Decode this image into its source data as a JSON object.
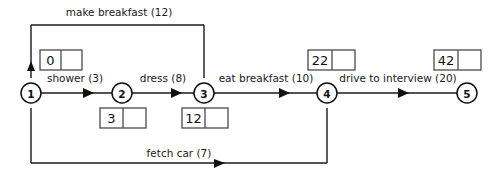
{
  "diagram": {
    "colors": {
      "line": "#1a1a1a",
      "box_stroke": "#4a4a4a",
      "background": "#ffffff",
      "text": "#111111"
    },
    "nodes": [
      {
        "id": "1",
        "label": "1",
        "cx": 31,
        "cy": 93
      },
      {
        "id": "2",
        "label": "2",
        "cx": 122,
        "cy": 93
      },
      {
        "id": "3",
        "label": "3",
        "cx": 204,
        "cy": 93
      },
      {
        "id": "4",
        "label": "4",
        "cx": 327,
        "cy": 93
      },
      {
        "id": "5",
        "label": "5",
        "cx": 467,
        "cy": 93
      }
    ],
    "edges": [
      {
        "name": "shower",
        "label": "shower (3)",
        "duration": 3,
        "from": "1",
        "to": "2",
        "label_x": 75,
        "label_y": 82
      },
      {
        "name": "dress",
        "label": "dress (8)",
        "duration": 8,
        "from": "2",
        "to": "3",
        "label_x": 163,
        "label_y": 82
      },
      {
        "name": "eat-breakfast",
        "label": "eat breakfast (10)",
        "duration": 10,
        "from": "3",
        "to": "4",
        "label_x": 266,
        "label_y": 82
      },
      {
        "name": "drive-to-interview",
        "label": "drive to interview (20)",
        "duration": 20,
        "from": "4",
        "to": "5",
        "label_x": 398,
        "label_y": 82
      },
      {
        "name": "make-breakfast",
        "label": "make breakfast (12)",
        "duration": 12,
        "from": "1",
        "to": "3",
        "label_x": 119,
        "label_y": 16
      },
      {
        "name": "fetch-car",
        "label": "fetch car (7)",
        "duration": 7,
        "from": "1",
        "to": "4",
        "label_x": 179,
        "label_y": 157
      }
    ],
    "time_boxes": [
      {
        "name": "time-box-node-1",
        "node": "1",
        "value": "0",
        "second": "",
        "x": 40,
        "y": 50
      },
      {
        "name": "time-box-node-2",
        "node": "2",
        "value": "3",
        "second": "",
        "x": 100,
        "y": 108
      },
      {
        "name": "time-box-node-3",
        "node": "3",
        "value": "12",
        "second": "",
        "x": 182,
        "y": 108
      },
      {
        "name": "time-box-node-4",
        "node": "4",
        "value": "22",
        "second": "",
        "x": 308,
        "y": 50
      },
      {
        "name": "time-box-node-5",
        "node": "5",
        "value": "42",
        "second": "",
        "x": 434,
        "y": 50
      }
    ]
  }
}
